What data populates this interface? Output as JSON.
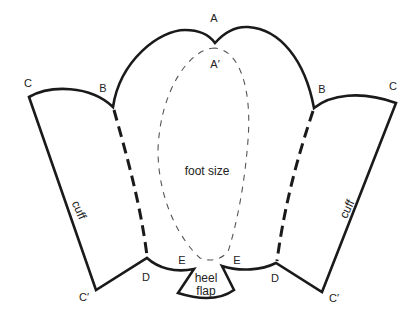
{
  "diagram": {
    "type": "sewing-pattern",
    "colors": {
      "outline": "#1a1a1a",
      "dashed_fold": "#1a1a1a",
      "foot_outline": "#555555",
      "background": "#ffffff"
    },
    "points": {
      "A": "A",
      "A_prime": "A′",
      "B_left": "B",
      "B_right": "B",
      "C_left": "C",
      "C_right": "C",
      "C_prime_left": "C′",
      "C_prime_right": "C′",
      "D_left": "D",
      "D_right": "D",
      "E_left": "E",
      "E_right": "E"
    },
    "regions": {
      "foot": "foot size",
      "cuff_left": "cuff",
      "cuff_right": "cuff",
      "heel_line1": "heel",
      "heel_line2": "flap"
    }
  }
}
